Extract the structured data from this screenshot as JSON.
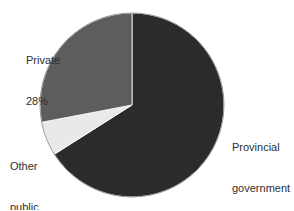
{
  "chart_data": {
    "type": "pie",
    "title": "",
    "subtitle": "",
    "xlabel": "",
    "ylabel": "",
    "legend_position": "none",
    "grid": false,
    "units": "percent",
    "start_angle_deg": 0,
    "direction": "clockwise",
    "categories": [
      "Provincial government",
      "Other public",
      "Private"
    ],
    "values": [
      66,
      6,
      28
    ],
    "colors": [
      "#2b2b2b",
      "#e9e9e9",
      "#5d5d5d"
    ],
    "slices": [
      {
        "name": "Provincial government",
        "value": 66,
        "value_text": "66%",
        "color": "#2b2b2b",
        "label_lines": [
          "Provincial",
          "government",
          "66%"
        ]
      },
      {
        "name": "Other public",
        "value": 6,
        "value_text": "6%",
        "color": "#e9e9e9",
        "label_lines": [
          "Other",
          "public",
          "6%"
        ]
      },
      {
        "name": "Private",
        "value": 28,
        "value_text": "28%",
        "color": "#5d5d5d",
        "label_lines": [
          "Private",
          "28%"
        ]
      }
    ]
  },
  "labels": {
    "private": {
      "line1": "Private",
      "line2": "28%"
    },
    "other_public": {
      "line1": "Other",
      "line2": "public",
      "line3": "6%"
    },
    "provincial": {
      "line1": "Provincial",
      "line2": "government",
      "line3": "66%"
    }
  },
  "style": {
    "background": "#ffffff",
    "text_color": "#2e2e2e",
    "outline_color": "#9a9a9a",
    "center_x": 132,
    "center_y": 105,
    "radius": 92
  }
}
